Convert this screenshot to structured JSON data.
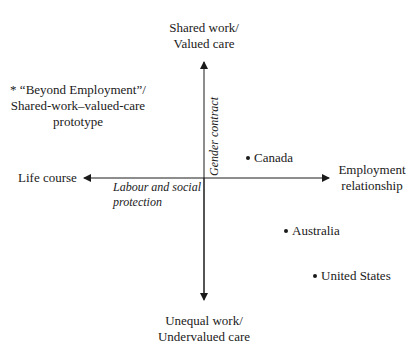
{
  "diagram": {
    "axes": {
      "vertical": {
        "top_label_line1": "Shared work/",
        "top_label_line2": "Valued care",
        "bottom_label_line1": "Unequal work/",
        "bottom_label_line2": "Undervalued care",
        "axis_label": "Gender contract"
      },
      "horizontal": {
        "left_label": "Life course",
        "right_label_line1": "Employment",
        "right_label_line2": "relationship",
        "axis_label_line1": "Labour and social",
        "axis_label_line2": "protection"
      }
    },
    "prototype": {
      "marker": "*",
      "line1": "* “Beyond Employment”/",
      "line2": "Shared-work–valued-care",
      "line3": "prototype"
    },
    "points": [
      {
        "label": "Canada"
      },
      {
        "label": "Australia"
      },
      {
        "label": "United States"
      }
    ],
    "colors": {
      "text": "#1a1a1a",
      "axis": "#1a1a1a",
      "background": "#ffffff"
    }
  }
}
